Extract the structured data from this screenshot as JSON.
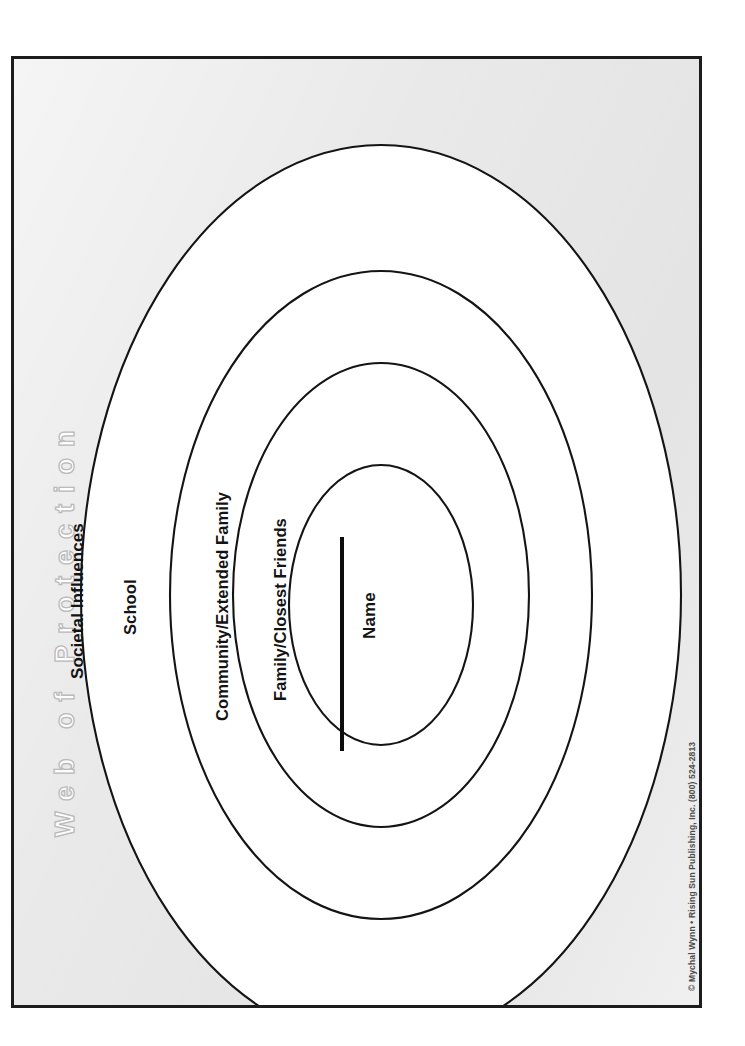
{
  "document": {
    "title": "Web of Protection",
    "orientation": "landscape-rotated-90",
    "background_color": "#e9e9e9",
    "border_color": "#1c1c1c",
    "ellipse_fill": "#ffffff",
    "ellipse_stroke": "#111111",
    "title_outline_color": "#b8b8b8"
  },
  "diagram": {
    "type": "concentric-ellipses",
    "rings": [
      {
        "id": "outer",
        "label": "Societal Influences",
        "level": 4,
        "cx": 367,
        "cy": 536,
        "rx": 300,
        "ry": 450
      },
      {
        "id": "second",
        "label": "School",
        "level": 3,
        "cx": 367,
        "cy": 536,
        "rx": 211,
        "ry": 324
      },
      {
        "id": "third",
        "label": "Community/Extended Family",
        "level": 2,
        "cx": 367,
        "cy": 536,
        "rx": 148,
        "ry": 232
      },
      {
        "id": "inner",
        "label": "Family/Closest Friends",
        "level": 1,
        "cx": 367,
        "cy": 546,
        "rx": 92,
        "ry": 140
      }
    ],
    "center_field": {
      "label": "Name",
      "has_write_on_rule": true
    }
  },
  "labels": {
    "societal_influences": "Societal Influences",
    "school": "School",
    "community_extended_family": "Community/Extended Family",
    "family_closest_friends": "Family/Closest Friends",
    "name": "Name"
  },
  "footer": {
    "copyright_line": "© Mychal Wynn • Rising Sun Publishing, Inc. (800) 524-2813",
    "website": "www.rspublishing.com"
  }
}
